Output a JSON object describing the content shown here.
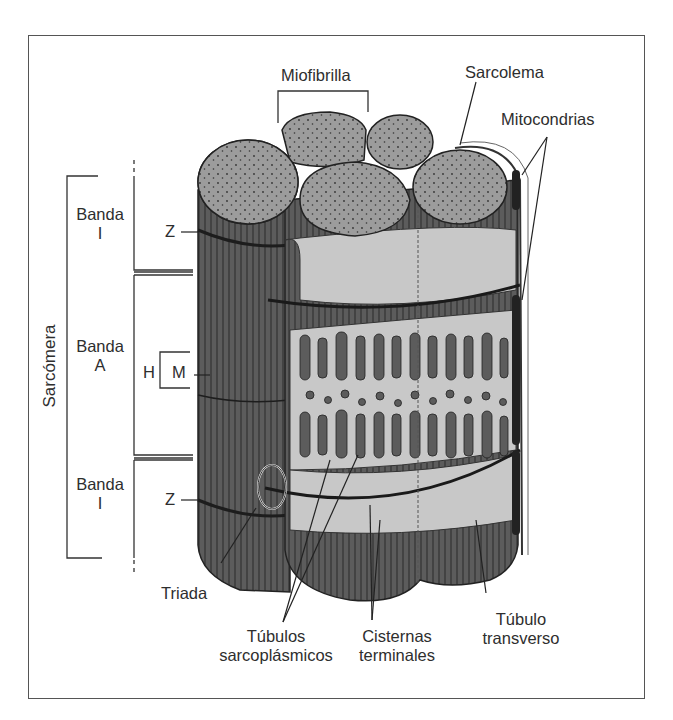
{
  "figure": {
    "colors": {
      "border": "#555555",
      "fiber_dark": "#5a5a5a",
      "myofibril_top": "#9a9a9a",
      "reticulum": "#c8c8c8",
      "text": "#2e2e2e"
    }
  },
  "labels": {
    "miofibrilla": "Miofibrilla",
    "sarcolema": "Sarcolema",
    "mitocondrias": "Mitocondrias",
    "sarcomera": "Sarcómera",
    "banda_i_top": {
      "line1": "Banda",
      "line2": "I"
    },
    "banda_a": {
      "line1": "Banda",
      "line2": "A"
    },
    "banda_i_bottom": {
      "line1": "Banda",
      "line2": "I"
    },
    "z_top": "Z",
    "z_bottom": "Z",
    "h": "H",
    "m": "M",
    "triada": "Triada",
    "tubulos_sarcoplasmicos": {
      "line1": "Túbulos",
      "line2": "sarcoplásmicos"
    },
    "cisternas_terminales": {
      "line1": "Cisternas",
      "line2": "terminales"
    },
    "tubulo_transverso": {
      "line1": "Túbulo",
      "line2": "transverso"
    }
  }
}
